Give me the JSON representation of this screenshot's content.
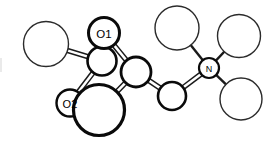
{
  "diagram": {
    "kind": "ball-and-stick chemical structure",
    "background_color": "#ffffff",
    "line_color": "#1a1a1a",
    "label_color": "#000000",
    "width": 272,
    "height": 141,
    "labels": {
      "o1": "O1",
      "o2": "O2",
      "n": "N"
    },
    "atoms": [
      {
        "id": "a1",
        "name": "terminal-sphere-upper-left",
        "label": "",
        "cx": 46,
        "cy": 44,
        "r": 22.5,
        "stroke": "thin",
        "stroke_width": 1.4
      },
      {
        "id": "a2",
        "name": "ring-atom-left",
        "label": "",
        "cx": 102,
        "cy": 61,
        "r": 14.5,
        "stroke": "bold",
        "stroke_width": 2.6
      },
      {
        "id": "a3",
        "name": "oxygen-o1",
        "label": "O1",
        "cx": 104,
        "cy": 33,
        "r": 15.5,
        "stroke": "bold",
        "stroke_width": 3.0
      },
      {
        "id": "a4",
        "name": "oxygen-o2",
        "label": "O2",
        "cx": 70,
        "cy": 103,
        "r": 13.5,
        "stroke": "bold",
        "stroke_width": 2.4
      },
      {
        "id": "a5",
        "name": "large-sphere-bottom-center",
        "label": "",
        "cx": 99,
        "cy": 110,
        "r": 25.5,
        "stroke": "bold",
        "stroke_width": 3.2
      },
      {
        "id": "a6",
        "name": "ring-atom-right",
        "label": "",
        "cx": 136,
        "cy": 72,
        "r": 15.0,
        "stroke": "bold",
        "stroke_width": 2.8
      },
      {
        "id": "a7",
        "name": "bridge-atom",
        "label": "",
        "cx": 172,
        "cy": 96,
        "r": 14.0,
        "stroke": "bold",
        "stroke_width": 2.6
      },
      {
        "id": "a8",
        "name": "nitrogen-center",
        "label": "N",
        "cx": 209,
        "cy": 68,
        "r": 10.0,
        "stroke": "bold",
        "stroke_width": 2.2
      },
      {
        "id": "a9",
        "name": "terminal-sphere-n-upper-left",
        "label": "",
        "cx": 177,
        "cy": 28,
        "r": 22.0,
        "stroke": "thin",
        "stroke_width": 1.4
      },
      {
        "id": "a10",
        "name": "terminal-sphere-n-upper-right",
        "label": "",
        "cx": 239,
        "cy": 36,
        "r": 21.5,
        "stroke": "thin",
        "stroke_width": 1.4
      },
      {
        "id": "a11",
        "name": "terminal-sphere-n-lower-right",
        "label": "",
        "cx": 241,
        "cy": 99,
        "r": 21.0,
        "stroke": "thin",
        "stroke_width": 1.4
      }
    ],
    "bonds": [
      {
        "name": "bond-a1-a2",
        "from": "a1",
        "to": "a2",
        "style": "double"
      },
      {
        "name": "bond-a2-a3",
        "from": "a2",
        "to": "a3",
        "style": "double"
      },
      {
        "name": "bond-a2-a4",
        "from": "a2",
        "to": "a4",
        "style": "double"
      },
      {
        "name": "bond-a3-a6",
        "from": "a3",
        "to": "a6",
        "style": "double"
      },
      {
        "name": "bond-a5-a6",
        "from": "a5",
        "to": "a6",
        "style": "double"
      },
      {
        "name": "bond-a6-a7",
        "from": "a6",
        "to": "a7",
        "style": "double"
      },
      {
        "name": "bond-a7-a8",
        "from": "a7",
        "to": "a8",
        "style": "double"
      },
      {
        "name": "bond-a8-a9",
        "from": "a8",
        "to": "a9",
        "style": "single"
      },
      {
        "name": "bond-a8-a10",
        "from": "a8",
        "to": "a10",
        "style": "single"
      },
      {
        "name": "bond-a8-a11",
        "from": "a8",
        "to": "a11",
        "style": "single"
      }
    ]
  }
}
